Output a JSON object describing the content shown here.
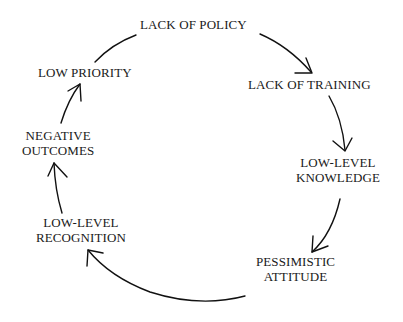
{
  "diagram": {
    "type": "cycle",
    "nodes": [
      {
        "id": "lack-of-policy",
        "lines": [
          "LACK OF POLICY"
        ]
      },
      {
        "id": "lack-of-training",
        "lines": [
          "LACK OF TRAINING"
        ]
      },
      {
        "id": "low-level-knowledge",
        "lines": [
          "LOW-LEVEL",
          "KNOWLEDGE"
        ]
      },
      {
        "id": "pessimistic-attitude",
        "lines": [
          "PESSIMISTIC",
          "ATTITUDE"
        ]
      },
      {
        "id": "low-level-recognition",
        "lines": [
          "LOW-LEVEL",
          "RECOGNITION"
        ]
      },
      {
        "id": "negative-outcomes",
        "lines": [
          "NEGATIVE",
          "OUTCOMES"
        ]
      },
      {
        "id": "low-priority",
        "lines": [
          "LOW PRIORITY"
        ]
      }
    ],
    "edges": [
      {
        "from": "lack-of-policy",
        "to": "lack-of-training"
      },
      {
        "from": "lack-of-training",
        "to": "low-level-knowledge"
      },
      {
        "from": "low-level-knowledge",
        "to": "pessimistic-attitude"
      },
      {
        "from": "pessimistic-attitude",
        "to": "low-level-recognition"
      },
      {
        "from": "low-level-recognition",
        "to": "negative-outcomes"
      },
      {
        "from": "negative-outcomes",
        "to": "low-priority"
      },
      {
        "from": "low-priority",
        "to": "lack-of-policy"
      }
    ]
  }
}
